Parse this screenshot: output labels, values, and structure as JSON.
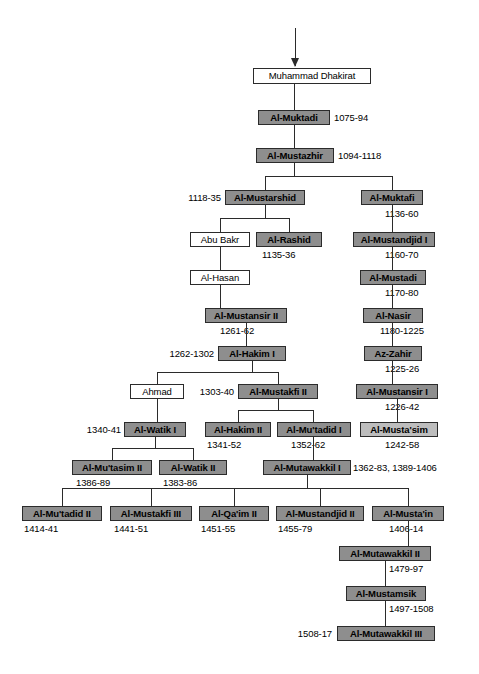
{
  "chart": {
    "colors": {
      "ruler_fill": "#8e8e8e",
      "ruler_light_fill": "#bdbdbd",
      "plain_fill": "#ffffff",
      "line": "#2b2b2b",
      "text": "#000000"
    },
    "entry_arrow": "down-arrow"
  },
  "nodes": [
    {
      "id": "muhammad_dhakirat",
      "label": "Muhammad Dhakirat",
      "style": "plain",
      "date": ""
    },
    {
      "id": "al_muktadi",
      "label": "Al-Muktadi",
      "style": "ruler",
      "date": "1075-94",
      "date_side": "right"
    },
    {
      "id": "al_mustazhir",
      "label": "Al-Mustazhir",
      "style": "ruler",
      "date": "1094-1118",
      "date_side": "right"
    },
    {
      "id": "al_mustarshid",
      "label": "Al-Mustarshid",
      "style": "ruler",
      "date": "1118-35",
      "date_side": "left"
    },
    {
      "id": "al_muktafi",
      "label": "Al-Muktafi",
      "style": "ruler",
      "date": "1136-60",
      "date_side": "below-right"
    },
    {
      "id": "abu_bakr",
      "label": "Abu Bakr",
      "style": "plain",
      "date": ""
    },
    {
      "id": "al_rashid",
      "label": "Al-Rashid",
      "style": "ruler",
      "date": "1135-36",
      "date_side": "below"
    },
    {
      "id": "al_mustandjid_i",
      "label": "Al-Mustandjid I",
      "style": "ruler",
      "date": "1160-70",
      "date_side": "below-right"
    },
    {
      "id": "al_hasan",
      "label": "Al-Hasan",
      "style": "plain",
      "date": ""
    },
    {
      "id": "al_mustadi",
      "label": "Al-Mustadi",
      "style": "ruler",
      "date": "1170-80",
      "date_side": "below-right"
    },
    {
      "id": "al_mustansir_ii",
      "label": "Al-Mustansir II",
      "style": "ruler",
      "date": "1261-62",
      "date_side": "below"
    },
    {
      "id": "al_nasir",
      "label": "Al-Nasir",
      "style": "ruler",
      "date": "1180-1225",
      "date_side": "below-right"
    },
    {
      "id": "al_hakim_i",
      "label": "Al-Hakim I",
      "style": "ruler",
      "date": "1262-1302",
      "date_side": "left"
    },
    {
      "id": "az_zahir",
      "label": "Az-Zahir",
      "style": "ruler",
      "date": "1225-26",
      "date_side": "below-right"
    },
    {
      "id": "ahmad",
      "label": "Ahmad",
      "style": "plain",
      "date": ""
    },
    {
      "id": "al_mustakfi_ii",
      "label": "Al-Mustakfi II",
      "style": "ruler",
      "date": "1303-40",
      "date_side": "left"
    },
    {
      "id": "al_mustansir_i",
      "label": "Al-Mustansir I",
      "style": "ruler",
      "date": "1226-42",
      "date_side": "below-right"
    },
    {
      "id": "al_watik_i",
      "label": "Al-Watik I",
      "style": "ruler",
      "date": "1340-41",
      "date_side": "left"
    },
    {
      "id": "al_hakim_ii",
      "label": "Al-Hakim II",
      "style": "ruler",
      "date": "1341-52",
      "date_side": "below"
    },
    {
      "id": "al_mutadid_i",
      "label": "Al-Mu'tadid I",
      "style": "ruler",
      "date": "1352-62",
      "date_side": "below"
    },
    {
      "id": "al_mustasim",
      "label": "Al-Musta'sim",
      "style": "ruler-light",
      "date": "1242-58",
      "date_side": "below-right"
    },
    {
      "id": "al_mutasim_ii",
      "label": "Al-Mu'tasim II",
      "style": "ruler",
      "date": "1386-89",
      "date_side": "below"
    },
    {
      "id": "al_watik_ii",
      "label": "Al-Watik II",
      "style": "ruler",
      "date": "1383-86",
      "date_side": "below"
    },
    {
      "id": "al_mutawakkil_i",
      "label": "Al-Mutawakkil I",
      "style": "ruler",
      "date": "1362-83, 1389-1406",
      "date_side": "right"
    },
    {
      "id": "al_mutadid_ii",
      "label": "Al-Mu'tadid II",
      "style": "ruler",
      "date": "1414-41",
      "date_side": "below"
    },
    {
      "id": "al_mustakfi_iii",
      "label": "Al-Mustakfi III",
      "style": "ruler",
      "date": "1441-51",
      "date_side": "below"
    },
    {
      "id": "al_qaim_ii",
      "label": "Al-Qa'im II",
      "style": "ruler",
      "date": "1451-55",
      "date_side": "below"
    },
    {
      "id": "al_mustandjid_ii",
      "label": "Al-Mustandjid II",
      "style": "ruler",
      "date": "1455-79",
      "date_side": "below"
    },
    {
      "id": "al_mustain",
      "label": "Al-Musta'in",
      "style": "ruler",
      "date": "1406-14",
      "date_side": "below-right"
    },
    {
      "id": "al_mutawakkil_ii",
      "label": "Al-Mutawakkil II",
      "style": "ruler",
      "date": "1479-97",
      "date_side": "below-right"
    },
    {
      "id": "al_mustamsik",
      "label": "Al-Mustamsik",
      "style": "ruler",
      "date": "1497-1508",
      "date_side": "below-right"
    },
    {
      "id": "al_mutawakkil_iii",
      "label": "Al-Mutawakkil III",
      "style": "ruler",
      "date": "1508-17",
      "date_side": "left"
    }
  ]
}
